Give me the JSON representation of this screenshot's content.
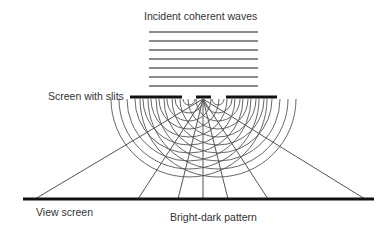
{
  "labels": {
    "title": "Incident coherent waves",
    "slits": "Screen with slits",
    "view_screen": "View screen",
    "pattern": "Bright-dark pattern"
  },
  "geometry": {
    "incident_lines_y": [
      32,
      41,
      50,
      59,
      68,
      77,
      86
    ],
    "incident_x": [
      149,
      258
    ],
    "slit_bar_y": 97,
    "slit_segments": [
      [
        130,
        182
      ],
      [
        196,
        211
      ],
      [
        226,
        277
      ]
    ],
    "slit_sources_x": [
      189,
      218
    ],
    "arc_radii": [
      6,
      14,
      22,
      30,
      38,
      46,
      54,
      62,
      70,
      78
    ],
    "view_screen": {
      "y": 199,
      "x1": 23,
      "x2": 374
    },
    "ray_origin": [
      203,
      97
    ],
    "ray_ends_x": [
      35,
      138,
      178,
      203,
      228,
      268,
      365
    ]
  },
  "colors": {
    "line": "#555555",
    "bar": "#111111",
    "text": "#333333"
  }
}
